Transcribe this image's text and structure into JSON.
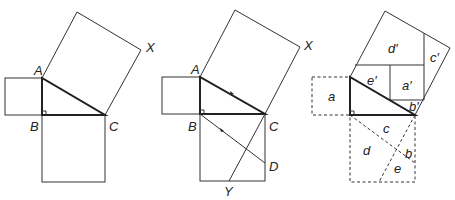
{
  "figures": [
    {
      "id": "figure-1",
      "description": "Right triangle ABC with squares on each side",
      "labels": {
        "A": "A",
        "B": "B",
        "C": "C",
        "X": "X"
      }
    },
    {
      "id": "figure-2",
      "description": "Construction with lines through B parallel to AC and C to Y",
      "labels": {
        "A": "A",
        "B": "B",
        "C": "C",
        "X": "X",
        "D": "D",
        "Y": "Y"
      }
    },
    {
      "id": "figure-3",
      "description": "Dissection proof: pieces a-e rearranged into a'-e'",
      "labels": {
        "a": "a",
        "b": "b",
        "c": "c",
        "d": "d",
        "e": "e",
        "a_prime": "a′",
        "b_prime": "b′",
        "c_prime": "c′",
        "d_prime": "d′",
        "e_prime": "e′"
      }
    }
  ],
  "colors": {
    "stroke": "#333333",
    "background": "#ffffff"
  }
}
